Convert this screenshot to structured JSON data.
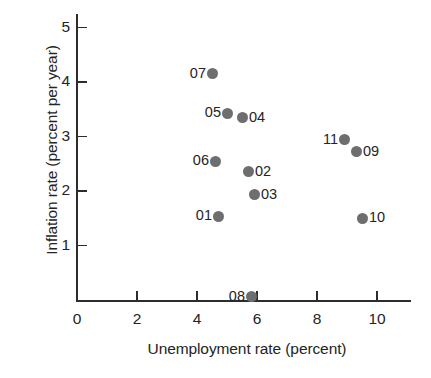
{
  "chart_data": {
    "type": "scatter",
    "title": "",
    "xlabel": "Unemployment rate (percent)",
    "ylabel": "Inflation rate (percent per year)",
    "xlim": [
      0,
      11.1
    ],
    "ylim": [
      0,
      5.3
    ],
    "xticks": [
      0,
      2,
      4,
      6,
      8,
      10
    ],
    "yticks": [
      1,
      2,
      3,
      4,
      5
    ],
    "xticklabels": [
      "0",
      "2",
      "4",
      "6",
      "8",
      "10"
    ],
    "yticklabels": [
      "1",
      "2",
      "3",
      "4",
      "5"
    ],
    "grid": false,
    "legend": "none",
    "marker_color": "#6e6e6e",
    "axis_color": "#2d2d2d",
    "points": [
      {
        "label": "01",
        "x": 4.7,
        "y": 1.54,
        "label_side": "left"
      },
      {
        "label": "02",
        "x": 5.7,
        "y": 2.35,
        "label_side": "right"
      },
      {
        "label": "03",
        "x": 5.9,
        "y": 1.93,
        "label_side": "right"
      },
      {
        "label": "04",
        "x": 5.5,
        "y": 3.34,
        "label_side": "right"
      },
      {
        "label": "05",
        "x": 5.0,
        "y": 3.43,
        "label_side": "left"
      },
      {
        "label": "06",
        "x": 4.6,
        "y": 2.55,
        "label_side": "left"
      },
      {
        "label": "07",
        "x": 4.5,
        "y": 4.15,
        "label_side": "left"
      },
      {
        "label": "08",
        "x": 5.8,
        "y": 0.06,
        "label_side": "left"
      },
      {
        "label": "09",
        "x": 9.3,
        "y": 2.72,
        "label_side": "right"
      },
      {
        "label": "10",
        "x": 9.5,
        "y": 1.5,
        "label_side": "right"
      },
      {
        "label": "11",
        "x": 8.9,
        "y": 2.94,
        "label_side": "left"
      }
    ]
  }
}
